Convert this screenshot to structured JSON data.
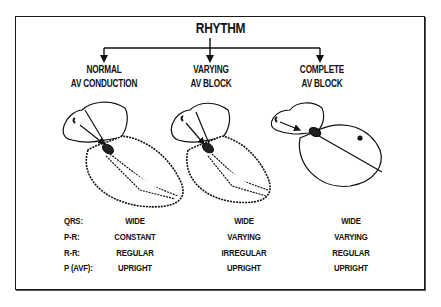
{
  "title": "RHYTHM",
  "columns": [
    {
      "line1": "NORMAL",
      "line2": "AV CONDUCTION",
      "heart": "normal-heart-with-conduction-pathway"
    },
    {
      "line1": "VARYING",
      "line2": "AV BLOCK",
      "heart": "heart-with-partial-conduction-pathway"
    },
    {
      "line1": "COMPLETE",
      "line2": "AV BLOCK",
      "heart": "heart-with-ectopic-ventricular-focus"
    }
  ],
  "table": {
    "rows": [
      {
        "label": "QRS:",
        "values": [
          "WIDE",
          "WIDE",
          "WIDE"
        ]
      },
      {
        "label": "P-R:",
        "values": [
          "CONSTANT",
          "VARYING",
          "VARYING"
        ]
      },
      {
        "label": "R-R:",
        "values": [
          "REGULAR",
          "IRREGULAR",
          "REGULAR"
        ]
      },
      {
        "label": "P (AVF):",
        "values": [
          "UPRIGHT",
          "UPRIGHT",
          "UPRIGHT"
        ]
      }
    ]
  }
}
